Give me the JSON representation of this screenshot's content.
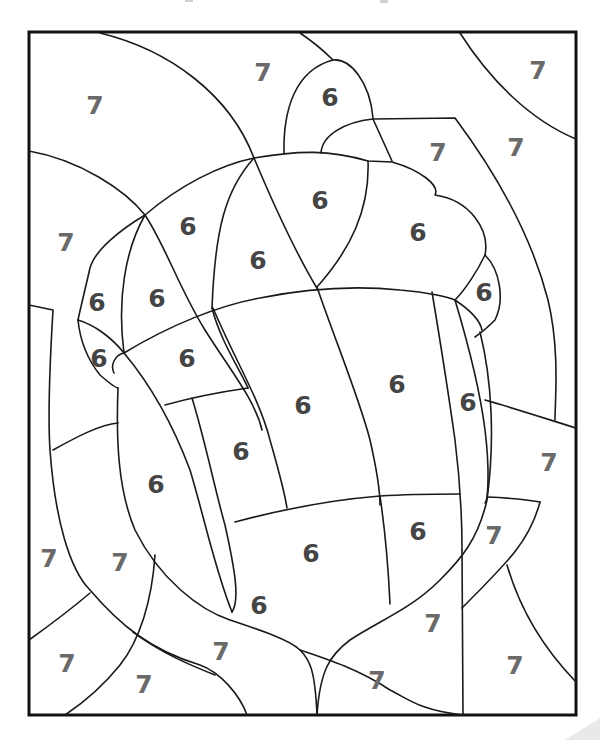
{
  "worksheet": {
    "type": "color-by-number",
    "subject": "acorn",
    "frame": {
      "x": 29,
      "y": 32,
      "width": 547,
      "height": 683
    },
    "colors": {
      "outline": "#1a1a1a",
      "frame": "#111111",
      "label_6": "#454545",
      "label_7": "#6a6a6a",
      "background": "#ffffff"
    },
    "legend_numbers": [
      "6",
      "7"
    ],
    "labels": [
      {
        "text": "7",
        "x": 95,
        "y": 105,
        "region": "background"
      },
      {
        "text": "7",
        "x": 263,
        "y": 72,
        "region": "background"
      },
      {
        "text": "6",
        "x": 330,
        "y": 97,
        "region": "acorn-stem"
      },
      {
        "text": "7",
        "x": 538,
        "y": 70,
        "region": "background"
      },
      {
        "text": "7",
        "x": 438,
        "y": 152,
        "region": "background"
      },
      {
        "text": "7",
        "x": 516,
        "y": 147,
        "region": "background"
      },
      {
        "text": "7",
        "x": 66,
        "y": 242,
        "region": "background"
      },
      {
        "text": "6",
        "x": 188,
        "y": 226,
        "region": "acorn-cap"
      },
      {
        "text": "6",
        "x": 320,
        "y": 200,
        "region": "acorn-cap"
      },
      {
        "text": "6",
        "x": 258,
        "y": 260,
        "region": "acorn-cap"
      },
      {
        "text": "6",
        "x": 418,
        "y": 232,
        "region": "acorn-cap"
      },
      {
        "text": "6",
        "x": 97,
        "y": 302,
        "region": "acorn-cap"
      },
      {
        "text": "6",
        "x": 157,
        "y": 298,
        "region": "acorn-cap"
      },
      {
        "text": "6",
        "x": 484,
        "y": 292,
        "region": "acorn-cap"
      },
      {
        "text": "6",
        "x": 99,
        "y": 358,
        "region": "acorn-cap"
      },
      {
        "text": "6",
        "x": 187,
        "y": 358,
        "region": "acorn-cap"
      },
      {
        "text": "6",
        "x": 303,
        "y": 405,
        "region": "acorn-body"
      },
      {
        "text": "6",
        "x": 397,
        "y": 384,
        "region": "acorn-body"
      },
      {
        "text": "6",
        "x": 468,
        "y": 402,
        "region": "acorn-body"
      },
      {
        "text": "6",
        "x": 241,
        "y": 451,
        "region": "acorn-body"
      },
      {
        "text": "7",
        "x": 549,
        "y": 462,
        "region": "background"
      },
      {
        "text": "6",
        "x": 156,
        "y": 484,
        "region": "acorn-body"
      },
      {
        "text": "6",
        "x": 418,
        "y": 531,
        "region": "acorn-body"
      },
      {
        "text": "7",
        "x": 494,
        "y": 535,
        "region": "background"
      },
      {
        "text": "6",
        "x": 311,
        "y": 553,
        "region": "acorn-body"
      },
      {
        "text": "7",
        "x": 49,
        "y": 558,
        "region": "background"
      },
      {
        "text": "7",
        "x": 120,
        "y": 562,
        "region": "background"
      },
      {
        "text": "6",
        "x": 259,
        "y": 605,
        "region": "acorn-body"
      },
      {
        "text": "7",
        "x": 433,
        "y": 623,
        "region": "background"
      },
      {
        "text": "7",
        "x": 221,
        "y": 651,
        "region": "background"
      },
      {
        "text": "7",
        "x": 67,
        "y": 663,
        "region": "background"
      },
      {
        "text": "7",
        "x": 515,
        "y": 665,
        "region": "background"
      },
      {
        "text": "7",
        "x": 144,
        "y": 684,
        "region": "background"
      },
      {
        "text": "7",
        "x": 377,
        "y": 680,
        "region": "background"
      }
    ]
  }
}
